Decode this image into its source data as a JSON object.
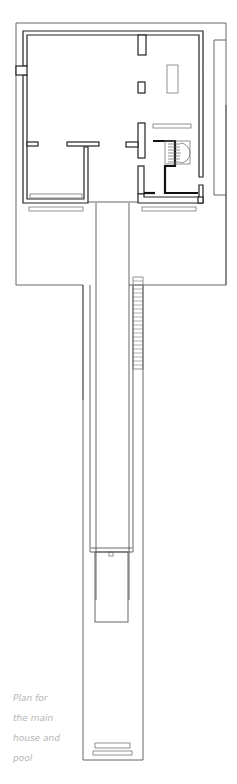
{
  "caption": {
    "lines": [
      "Plan for",
      "the main",
      "house and",
      "pool"
    ]
  },
  "colors": {
    "line": "#222222",
    "caption": "#b5b5b5",
    "background": "#ffffff"
  }
}
